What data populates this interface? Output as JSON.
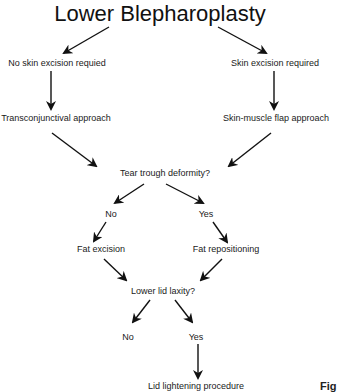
{
  "diagram": {
    "title": "Lower Blepharoplasty",
    "nodes": {
      "no_skin_excision": "No skin excision requied",
      "skin_excision": "Skin excision required",
      "transconjunctival": "Transconjunctival approach",
      "skin_muscle_flap": "Skin-muscle flap approach",
      "tear_trough": "Tear trough deformity?",
      "tear_trough_no": "No",
      "tear_trough_yes": "Yes",
      "fat_excision": "Fat excision",
      "fat_repositioning": "Fat repositioning",
      "lower_lid_laxity": "Lower lid laxity?",
      "laxity_no": "No",
      "laxity_yes": "Yes",
      "lid_tightening": "Lid lightening procedure"
    },
    "edges": [
      [
        "title",
        "no_skin_excision"
      ],
      [
        "title",
        "skin_excision"
      ],
      [
        "no_skin_excision",
        "transconjunctival"
      ],
      [
        "skin_excision",
        "skin_muscle_flap"
      ],
      [
        "transconjunctival",
        "tear_trough"
      ],
      [
        "skin_muscle_flap",
        "tear_trough"
      ],
      [
        "tear_trough",
        "tear_trough_no"
      ],
      [
        "tear_trough",
        "tear_trough_yes"
      ],
      [
        "tear_trough_no",
        "fat_excision"
      ],
      [
        "tear_trough_yes",
        "fat_repositioning"
      ],
      [
        "fat_excision",
        "lower_lid_laxity"
      ],
      [
        "fat_repositioning",
        "lower_lid_laxity"
      ],
      [
        "lower_lid_laxity",
        "laxity_no"
      ],
      [
        "lower_lid_laxity",
        "laxity_yes"
      ],
      [
        "laxity_yes",
        "lid_tightening"
      ]
    ],
    "caption_fragment": "Fig"
  }
}
